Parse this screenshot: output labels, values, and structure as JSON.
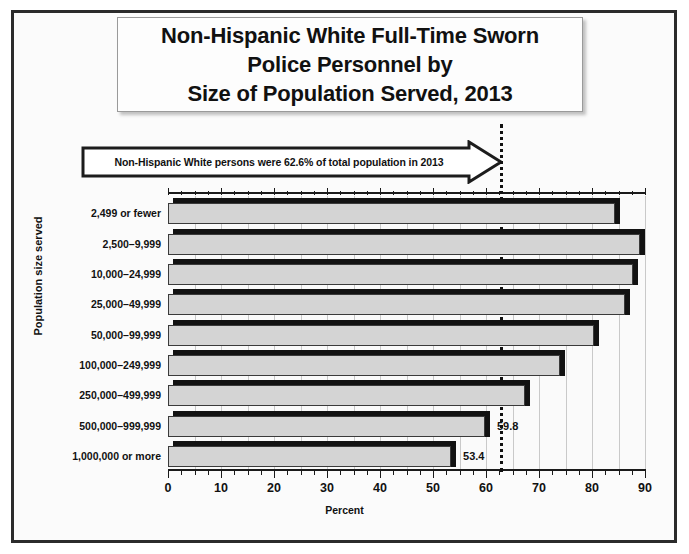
{
  "title": {
    "lines": [
      "Non-Hispanic White Full-Time Sworn",
      "Police Personnel by",
      "Size of Population Served, 2013"
    ]
  },
  "callout": {
    "text": "Non-Hispanic White persons were 62.6% of total population in 2013",
    "points_to_value": 62.6
  },
  "colors": {
    "bar_face": "#d4d4d4",
    "bar_shadow": "#121212",
    "text": "#111111",
    "gridline": "#c9c9c9",
    "frame": "#2b2b2b",
    "reference_line": "#111111"
  },
  "chart_data": {
    "type": "bar",
    "orientation": "horizontal",
    "title": "Non-Hispanic White Full-Time Sworn Police Personnel by Size of Population Served, 2013",
    "xlabel": "Percent",
    "ylabel": "Population size served",
    "xlim": [
      0,
      90
    ],
    "xticks": [
      0,
      10,
      20,
      30,
      40,
      50,
      60,
      70,
      80,
      90
    ],
    "minor_tick_interval": 2.5,
    "gridline_interval": 5,
    "grid": true,
    "legend": "none",
    "categories": [
      "2,499 or fewer",
      "2,500–9,999",
      "10,000–24,999",
      "25,000–49,999",
      "50,000–99,999",
      "100,000–249,999",
      "250,000–499,999",
      "500,000–999,999",
      "1,000,000 or more"
    ],
    "values": [
      84.4,
      89.0,
      87.8,
      86.3,
      80.4,
      73.9,
      67.4,
      59.8,
      53.4
    ],
    "value_labels": [
      "84.4",
      "89.0",
      "87.8",
      "86.3",
      "80.4",
      "73.9",
      "67.4",
      "59.8",
      "53.4"
    ],
    "annotations": [
      {
        "type": "reference-line",
        "value": 62.6,
        "style": "dotted",
        "label": "Non-Hispanic White persons were 62.6% of total population in 2013"
      }
    ]
  }
}
